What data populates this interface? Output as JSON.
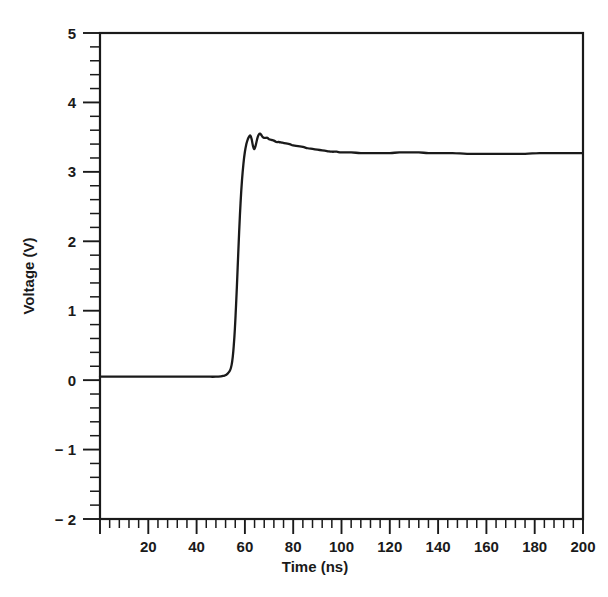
{
  "chart_data": {
    "type": "line",
    "title": "",
    "xlabel": "Time (ns)",
    "ylabel": "Voltage (V)",
    "xlim": [
      0,
      200
    ],
    "ylim": [
      -2,
      5
    ],
    "grid": false,
    "legend": null,
    "x_ticks": [
      0,
      20,
      40,
      60,
      80,
      100,
      120,
      140,
      160,
      180,
      200
    ],
    "x_tick_labels": [
      "",
      "20",
      "40",
      "60",
      "80",
      "100",
      "120",
      "140",
      "160",
      "180",
      "200"
    ],
    "x_minor_step": 4,
    "y_ticks": [
      -2,
      -1,
      0,
      1,
      2,
      3,
      4,
      5
    ],
    "y_tick_labels": [
      "− 2",
      "− 1",
      "0",
      "1",
      "2",
      "3",
      "4",
      "5"
    ],
    "y_minor_step": 0.2,
    "series": [
      {
        "name": "Voltage",
        "color": "#1a1a1a",
        "x": [
          0,
          4,
          8,
          12,
          16,
          20,
          24,
          28,
          32,
          36,
          40,
          44,
          48,
          51,
          53,
          54.5,
          55.5,
          56.3,
          57.0,
          57.6,
          58.2,
          58.8,
          59.4,
          60.0,
          60.6,
          61.2,
          61.8,
          62.3,
          62.8,
          63.3,
          63.8,
          64.3,
          64.8,
          65.3,
          65.8,
          66.3,
          66.8,
          67.4,
          68.0,
          68.6,
          69.3,
          70.0,
          71.0,
          72.0,
          73.0,
          74.0,
          75.5,
          77.0,
          78.5,
          80.0,
          82.0,
          84.0,
          86.0,
          88.0,
          90.0,
          92.0,
          94.0,
          96.0,
          98.0,
          100.0,
          104.0,
          108.0,
          112.0,
          116.0,
          120.0,
          124.0,
          128.0,
          132.0,
          136.0,
          140.0,
          146.0,
          152.0,
          158.0,
          164.0,
          170.0,
          176.0,
          182.0,
          188.0,
          194.0,
          200.0
        ],
        "y": [
          0.05,
          0.05,
          0.05,
          0.05,
          0.05,
          0.05,
          0.05,
          0.05,
          0.05,
          0.05,
          0.05,
          0.05,
          0.05,
          0.06,
          0.1,
          0.22,
          0.55,
          1.05,
          1.62,
          2.12,
          2.55,
          2.88,
          3.12,
          3.29,
          3.4,
          3.47,
          3.51,
          3.52,
          3.47,
          3.38,
          3.33,
          3.36,
          3.43,
          3.5,
          3.54,
          3.55,
          3.53,
          3.5,
          3.49,
          3.49,
          3.49,
          3.47,
          3.46,
          3.45,
          3.43,
          3.43,
          3.42,
          3.41,
          3.4,
          3.38,
          3.37,
          3.36,
          3.34,
          3.33,
          3.32,
          3.31,
          3.3,
          3.29,
          3.29,
          3.28,
          3.28,
          3.27,
          3.27,
          3.27,
          3.27,
          3.28,
          3.28,
          3.28,
          3.27,
          3.27,
          3.27,
          3.26,
          3.26,
          3.26,
          3.26,
          3.26,
          3.27,
          3.27,
          3.27,
          3.27
        ]
      }
    ],
    "annotations": [],
    "notes": {
      "baseline_voltage": 0.05,
      "settled_voltage": 3.27,
      "peak_overshoot_voltage": 3.55,
      "rise_start_ns": 54.5,
      "rise_end_ns": 62.0
    }
  },
  "axes": {
    "x_title": "Time (ns)",
    "y_title": "Voltage (V)"
  }
}
